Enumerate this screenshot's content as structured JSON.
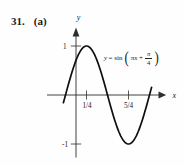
{
  "title": {
    "problem_number": "31.",
    "part": "(a)"
  },
  "colors": {
    "background": "#fefefe",
    "ink": "#1c1c1c",
    "axis": "#2e2e2e",
    "curve": "#0e0e0e"
  },
  "graph": {
    "axis_labels": {
      "x": "x",
      "y": "y"
    },
    "tick_labels": {
      "y_pos": "1",
      "y_neg": "-1",
      "x_first": "1/4",
      "x_second": "5/4"
    },
    "equation": {
      "lhs": "y",
      "eq_sin": "= sin",
      "open_paren": "(",
      "arg": "πx",
      "plus": "+",
      "frac_num": "π",
      "frac_den": "4",
      "close_paren": ")"
    }
  },
  "chart_data": {
    "type": "line",
    "xlabel": "x",
    "ylabel": "y",
    "grid": false,
    "legend": "none",
    "xlim": [
      -0.65,
      2.0
    ],
    "ylim": [
      -1.43,
      1.4
    ],
    "x_ticks": [
      0.25,
      1.25
    ],
    "x_tick_labels": [
      "1/4",
      "5/4"
    ],
    "y_ticks": [
      1,
      -1
    ],
    "y_tick_labels": [
      "1",
      "-1"
    ],
    "series": [
      {
        "name": "y = sin(πx + π/4)",
        "function": "y = sin(pi*x + pi/4)",
        "amplitude": 1,
        "period": 2,
        "phase_shift": -0.25,
        "x_drawn_range": [
          -0.3,
          1.81
        ],
        "key_points": [
          {
            "x": -0.25,
            "y": 0,
            "note": "zero, ascending"
          },
          {
            "x": 0,
            "y": 0.707,
            "note": "y-intercept"
          },
          {
            "x": 0.25,
            "y": 1,
            "note": "maximum"
          },
          {
            "x": 0.75,
            "y": 0,
            "note": "zero, descending"
          },
          {
            "x": 1.25,
            "y": -1,
            "note": "minimum"
          },
          {
            "x": 1.75,
            "y": 0,
            "note": "zero, ascending"
          }
        ],
        "points": {
          "x": [
            -0.25,
            -0.125,
            0,
            0.125,
            0.25,
            0.375,
            0.5,
            0.625,
            0.75,
            0.875,
            1.0,
            1.125,
            1.25,
            1.375,
            1.5,
            1.625,
            1.75
          ],
          "y": [
            0,
            0.383,
            0.707,
            0.924,
            1.0,
            0.924,
            0.707,
            0.383,
            0,
            -0.383,
            -0.707,
            -0.924,
            -1.0,
            -0.924,
            -0.707,
            -0.383,
            0
          ]
        }
      }
    ]
  }
}
